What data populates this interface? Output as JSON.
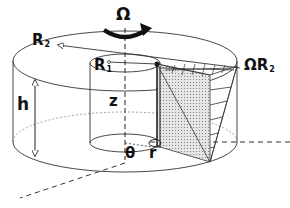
{
  "figure": {
    "colors": {
      "line": "#222222",
      "shade": "#cccccc",
      "background": "#ffffff"
    },
    "labels": {
      "omega": "Ω",
      "outer_radius": {
        "main": "R",
        "sub": "2"
      },
      "inner_radius": {
        "main": "R",
        "sub": "1"
      },
      "height": "h",
      "axial": "z",
      "angle": "θ",
      "radial": "r",
      "wall_speed": {
        "main": "ΩR",
        "sub": "2"
      }
    }
  }
}
